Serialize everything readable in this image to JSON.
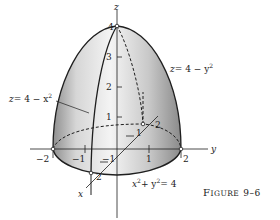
{
  "figure": {
    "caption": "FIGURE 9–6",
    "caption_parts": {
      "big": "F",
      "small": "IGURE",
      "num": "9–6"
    },
    "surface_description": "Solid dome bounded by z = 4 − x², z = 4 − y² over disk x² + y² = 4"
  },
  "axes": {
    "z_label": "z",
    "y_label": "y",
    "x_label": "x",
    "z_ticks": [
      "1",
      "2",
      "3",
      "4"
    ],
    "y_ticks": [
      "−2",
      "−1",
      "1",
      "2"
    ],
    "x_ticks": [
      "−1",
      "1",
      "2"
    ]
  },
  "annotations": {
    "eq_y": {
      "lhs": "z",
      "rhs": "= 4 − y",
      "exp": "2"
    },
    "eq_x": {
      "lhs": "z",
      "rhs": "= 4 − x",
      "exp": "2"
    },
    "eq_circle": {
      "a": "x",
      "b": "+ y",
      "c": "= 4",
      "exp": "2"
    }
  },
  "colors": {
    "background": "#ffffff",
    "ink": "#1e1e1e",
    "shade_light": "#f2f2f2",
    "shade_dark": "#9a9a9a"
  }
}
